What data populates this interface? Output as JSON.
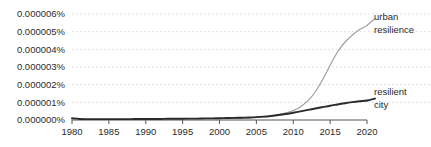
{
  "chart_data": {
    "type": "line",
    "title": "",
    "xlabel": "",
    "ylabel": "",
    "grid": true,
    "legend_position": "right-inline",
    "xlim": [
      1980,
      2020
    ],
    "ylim": [
      0.0,
      6e-06
    ],
    "x_ticks": [
      "1980",
      "1985",
      "1990",
      "1995",
      "2000",
      "2005",
      "2010",
      "2015",
      "2020"
    ],
    "y_ticks": [
      "0.000006%",
      "0.000005%",
      "0.000004%",
      "0.000003%",
      "0.000002%",
      "0.000001%",
      "0.000000%"
    ],
    "x": [
      1980,
      1981,
      1982,
      1983,
      1984,
      1985,
      1986,
      1987,
      1988,
      1989,
      1990,
      1991,
      1992,
      1993,
      1994,
      1995,
      1996,
      1997,
      1998,
      1999,
      2000,
      2001,
      2002,
      2003,
      2004,
      2005,
      2006,
      2007,
      2008,
      2009,
      2010,
      2011,
      2012,
      2013,
      2014,
      2015,
      2016,
      2017,
      2018,
      2019,
      2020
    ],
    "series": [
      {
        "name": "urban resilience",
        "color": "#a0a0a0",
        "label_lines": [
          "urban",
          "resilience"
        ],
        "values": [
          2e-08,
          2e-08,
          2e-08,
          2e-08,
          2e-08,
          2e-08,
          2e-08,
          2e-08,
          2e-08,
          2e-08,
          2e-08,
          2e-08,
          2e-08,
          3e-08,
          3e-08,
          3e-08,
          4e-08,
          4e-08,
          5e-08,
          5e-08,
          6e-08,
          7e-08,
          8e-08,
          1e-07,
          1.2e-07,
          1.5e-07,
          1.9e-07,
          2.4e-07,
          3.1e-07,
          4e-07,
          5.3e-07,
          7.5e-07,
          1.1e-06,
          1.6e-06,
          2.3e-06,
          3.1e-06,
          3.85e-06,
          4.4e-06,
          4.8e-06,
          5.12e-06,
          5.35e-06
        ]
      },
      {
        "name": "resilient city",
        "color": "#2a2a2a",
        "label_lines": [
          "resilient",
          "city"
        ],
        "values": [
          1e-07,
          6e-08,
          5e-08,
          5e-08,
          5e-08,
          5e-08,
          5e-08,
          5e-08,
          5e-08,
          6e-08,
          6e-08,
          6e-08,
          6e-08,
          7e-08,
          7e-08,
          7e-08,
          8e-08,
          8e-08,
          9e-08,
          9e-08,
          1e-07,
          1.1e-07,
          1.2e-07,
          1.3e-07,
          1.4e-07,
          1.6e-07,
          1.9e-07,
          2.3e-07,
          2.8e-07,
          3.4e-07,
          4.1e-07,
          4.9e-07,
          5.7e-07,
          6.5e-07,
          7.3e-07,
          8.1e-07,
          8.8e-07,
          9.5e-07,
          1.01e-06,
          1.06e-06,
          1.1e-06
        ]
      }
    ]
  }
}
